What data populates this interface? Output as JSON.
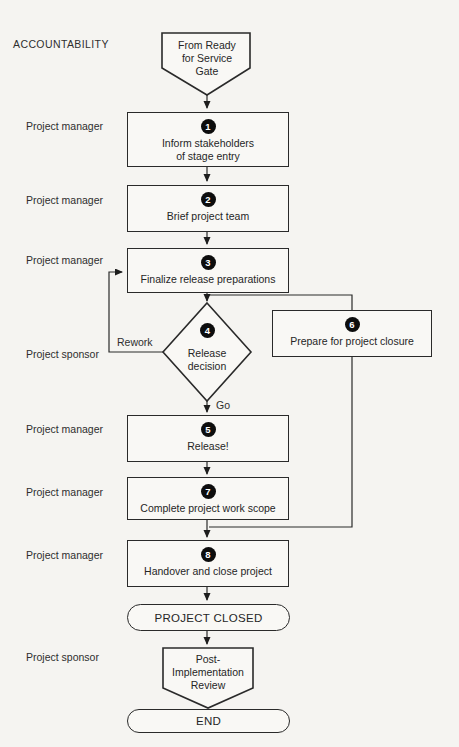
{
  "page": {
    "colors": {
      "background": "#f5f4f1",
      "line": "#262626",
      "shape_fill": "#f9f8f5",
      "badge_fill": "#0d0d0d",
      "badge_text": "#ffffff"
    }
  },
  "accountability": {
    "heading": "ACCOUNTABILITY"
  },
  "flow": {
    "start_gate": {
      "lines": [
        "From Ready",
        "for Service",
        "Gate"
      ]
    },
    "steps": [
      {
        "num": "1",
        "owner": "Project manager",
        "lines": [
          "Inform stakeholders",
          "of stage entry"
        ]
      },
      {
        "num": "2",
        "owner": "Project manager",
        "lines": [
          "Brief project team"
        ]
      },
      {
        "num": "3",
        "owner": "Project manager",
        "lines": [
          "Finalize release preparations"
        ]
      },
      {
        "num": "4",
        "owner": "Project sponsor",
        "type": "decision",
        "lines": [
          "Release",
          "decision"
        ]
      },
      {
        "num": "5",
        "owner": "Project manager",
        "lines": [
          "Release!"
        ]
      },
      {
        "num": "6",
        "lines": [
          "Prepare for project closure"
        ]
      },
      {
        "num": "7",
        "owner": "Project manager",
        "lines": [
          "Complete project work scope"
        ]
      },
      {
        "num": "8",
        "owner": "Project manager",
        "lines": [
          "Handover and close project"
        ]
      }
    ],
    "edge_labels": {
      "rework": "Rework",
      "go": "Go"
    },
    "terminators": {
      "project_closed": "PROJECT CLOSED",
      "end": "END"
    },
    "post_review": {
      "owner": "Project sponsor",
      "lines": [
        "Post-",
        "Implementation",
        "Review"
      ]
    }
  }
}
